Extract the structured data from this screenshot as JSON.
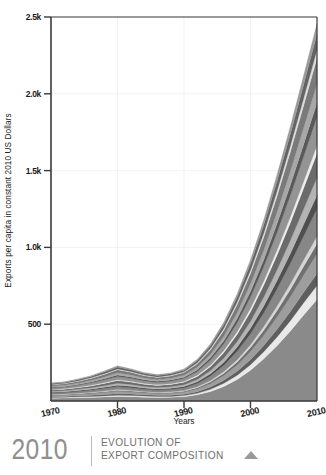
{
  "chart_data": {
    "type": "area",
    "title": "Evolution of Export Composition",
    "xlabel": "Years",
    "ylabel": "Exports per capita in constant 2010 US Dollars",
    "xlim": [
      1970,
      2010
    ],
    "ylim": [
      0,
      2500
    ],
    "grid": true,
    "legend_position": "none",
    "stacked": true,
    "x": [
      1970,
      1972,
      1974,
      1976,
      1978,
      1980,
      1982,
      1984,
      1986,
      1988,
      1990,
      1992,
      1994,
      1996,
      1998,
      2000,
      2002,
      2004,
      2006,
      2008,
      2010
    ],
    "xticks": [
      1970,
      1980,
      1990,
      2000,
      2010
    ],
    "xtick_labels": [
      "1970",
      "1980",
      "1990",
      "2000",
      "2010"
    ],
    "yticks": [
      500,
      1000,
      1500,
      2000,
      2500
    ],
    "ytick_labels": [
      "500",
      "1.0k",
      "1.5k",
      "2.0k",
      "2.5k"
    ],
    "series": [
      {
        "name": "band-01",
        "color": "#8a8a8a",
        "values": [
          18,
          19,
          21,
          23,
          26,
          30,
          28,
          25,
          23,
          24,
          28,
          40,
          62,
          95,
          140,
          200,
          275,
          360,
          455,
          560,
          660
        ]
      },
      {
        "name": "band-02",
        "color": "#e9e9e9",
        "values": [
          5,
          5,
          6,
          6,
          7,
          8,
          8,
          7,
          6,
          6,
          7,
          10,
          14,
          20,
          27,
          36,
          46,
          57,
          68,
          80,
          92
        ]
      },
      {
        "name": "band-03",
        "color": "#5e5e5e",
        "values": [
          6,
          6,
          7,
          8,
          9,
          10,
          9,
          8,
          8,
          8,
          9,
          11,
          15,
          20,
          26,
          33,
          41,
          50,
          59,
          68,
          78
        ]
      },
      {
        "name": "band-04",
        "color": "#9d9d9d",
        "values": [
          7,
          8,
          9,
          11,
          13,
          15,
          14,
          12,
          11,
          12,
          13,
          17,
          23,
          31,
          41,
          53,
          66,
          81,
          96,
          112,
          128
        ]
      },
      {
        "name": "band-05",
        "color": "#707070",
        "values": [
          4,
          4,
          5,
          5,
          6,
          7,
          6,
          6,
          5,
          6,
          6,
          8,
          11,
          15,
          20,
          26,
          33,
          41,
          49,
          57,
          66
        ]
      },
      {
        "name": "band-06",
        "color": "#d5d5d5",
        "values": [
          3,
          3,
          3,
          4,
          4,
          5,
          5,
          4,
          4,
          4,
          5,
          6,
          8,
          11,
          15,
          19,
          24,
          30,
          36,
          42,
          48
        ]
      },
      {
        "name": "band-07",
        "color": "#878787",
        "values": [
          9,
          10,
          11,
          13,
          16,
          19,
          17,
          15,
          14,
          15,
          17,
          22,
          30,
          41,
          55,
          71,
          90,
          111,
          133,
          156,
          180
        ]
      },
      {
        "name": "band-08",
        "color": "#4f4f4f",
        "values": [
          5,
          5,
          6,
          7,
          8,
          9,
          9,
          8,
          7,
          8,
          9,
          11,
          15,
          20,
          27,
          35,
          44,
          54,
          65,
          76,
          88
        ]
      },
      {
        "name": "band-09",
        "color": "#b4b4b4",
        "values": [
          6,
          7,
          8,
          9,
          11,
          13,
          12,
          10,
          10,
          10,
          12,
          15,
          20,
          27,
          36,
          46,
          58,
          71,
          85,
          100,
          115
        ]
      },
      {
        "name": "band-10",
        "color": "#6b6b6b",
        "values": [
          8,
          9,
          10,
          12,
          14,
          17,
          16,
          14,
          13,
          14,
          16,
          20,
          27,
          36,
          48,
          62,
          78,
          96,
          115,
          135,
          156
        ]
      },
      {
        "name": "band-11",
        "color": "#ededed",
        "values": [
          3,
          3,
          4,
          4,
          5,
          6,
          5,
          5,
          4,
          5,
          5,
          7,
          9,
          12,
          16,
          21,
          26,
          32,
          39,
          45,
          52
        ]
      },
      {
        "name": "band-12",
        "color": "#949494",
        "values": [
          10,
          11,
          12,
          15,
          18,
          21,
          19,
          17,
          16,
          17,
          19,
          25,
          33,
          44,
          58,
          75,
          94,
          116,
          139,
          163,
          188
        ]
      },
      {
        "name": "band-13",
        "color": "#595959",
        "values": [
          5,
          5,
          6,
          7,
          8,
          10,
          9,
          8,
          7,
          8,
          9,
          12,
          16,
          21,
          28,
          36,
          45,
          56,
          67,
          78,
          90
        ]
      },
      {
        "name": "band-14",
        "color": "#a8a8a8",
        "values": [
          7,
          7,
          8,
          10,
          12,
          14,
          13,
          11,
          11,
          11,
          13,
          16,
          22,
          29,
          39,
          50,
          63,
          77,
          92,
          108,
          124
        ]
      },
      {
        "name": "band-15",
        "color": "#7a7a7a",
        "values": [
          9,
          10,
          11,
          13,
          16,
          19,
          17,
          15,
          14,
          15,
          17,
          22,
          29,
          39,
          52,
          67,
          84,
          103,
          124,
          145,
          167
        ]
      },
      {
        "name": "band-16",
        "color": "#dedede",
        "values": [
          3,
          3,
          4,
          4,
          5,
          6,
          5,
          5,
          4,
          5,
          5,
          7,
          9,
          13,
          17,
          22,
          27,
          34,
          40,
          47,
          54
        ]
      },
      {
        "name": "band-17",
        "color": "#636363",
        "values": [
          6,
          6,
          7,
          8,
          10,
          12,
          11,
          9,
          9,
          9,
          11,
          14,
          18,
          24,
          32,
          41,
          52,
          64,
          76,
          89,
          103
        ]
      },
      {
        "name": "band-18",
        "color": "#9a9a9a",
        "values": [
          4,
          4,
          5,
          6,
          7,
          8,
          7,
          6,
          6,
          6,
          7,
          9,
          12,
          16,
          21,
          27,
          34,
          42,
          50,
          59,
          68
        ]
      }
    ]
  },
  "footer": {
    "year": "2010",
    "line1": "EVOLUTION OF",
    "line2": "EXPORT COMPOSITION",
    "marker": "play-triangle"
  }
}
